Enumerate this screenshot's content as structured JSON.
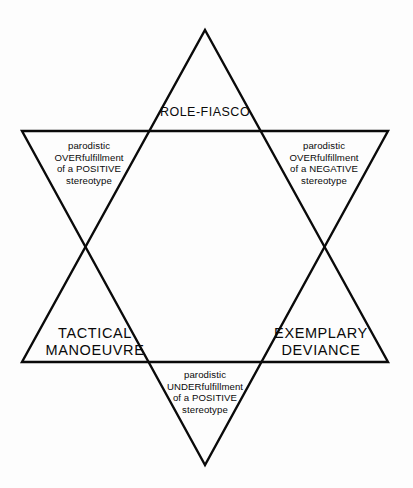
{
  "diagram": {
    "type": "hexagram",
    "stroke_color": "#0a0a0a",
    "background_color": "#fdfdfd",
    "points": {
      "up_triangle": "205,30 388,362 22,362",
      "down_triangle": "205,465 22,131 388,131"
    }
  },
  "labels": {
    "top_point": "ROLE-FIASCO",
    "upper_left_block": "parodistic\nOVERfulfillment\nof a POSITIVE\nstereotype",
    "upper_right_block": "parodistic\nOVERfulfillment\nof a NEGATIVE\nstereotype",
    "lower_left_point": "TACTICAL\nMANOEUVRE",
    "lower_right_point": "EXEMPLARY\nDEVIANCE",
    "bottom_block": "parodistic\nUNDERfulfillment\nof a POSITIVE\nstereotype"
  }
}
